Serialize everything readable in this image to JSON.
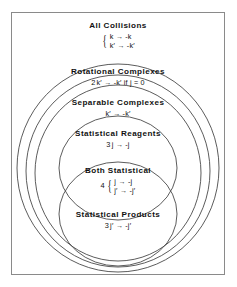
{
  "figure": {
    "title_note": "Nested set (Venn) diagram of collision classes",
    "border_color": "#8a8a8a",
    "curve_color": "#4a4a4a",
    "text_color": "#111111"
  },
  "sets": [
    {
      "id": "all-collisions",
      "label": "All Collisions",
      "number": "",
      "brace": true,
      "relations": [
        "k → -k",
        "k′ → -k′"
      ]
    },
    {
      "id": "rotational-complexes",
      "label": "Rotational Complexes",
      "number": "2",
      "brace": false,
      "relations": [
        "k′ → -k′ if  j = 0"
      ]
    },
    {
      "id": "separable-complexes",
      "label": "Separable Complexes",
      "number": "",
      "brace": false,
      "relations": [
        "k′ → -k′"
      ]
    },
    {
      "id": "statistical-reagents",
      "label": "Statistical Reagents",
      "number": "3",
      "brace": false,
      "relations": [
        "j → -j"
      ]
    },
    {
      "id": "both-statistical",
      "label": "Both Statistical",
      "number": "4",
      "brace": true,
      "relations": [
        "j → -j",
        "j′ → -j′"
      ]
    },
    {
      "id": "statistical-products",
      "label": "Statistical Products",
      "number": "3",
      "brace": false,
      "relations": [
        "j′ → -j′"
      ]
    }
  ],
  "labels": {
    "all_collisions": "All Collisions",
    "all_collisions_rel1": "k → -k",
    "all_collisions_rel2": "k′ → -k′",
    "rotational": "Rotational Complexes",
    "rotational_num": "2",
    "rotational_rel": "k′ → -k′ if  j = 0",
    "separable": "Separable Complexes",
    "separable_rel": "k′ → -k′",
    "reagents": "Statistical Reagents",
    "reagents_num": "3",
    "reagents_rel": "j → -j",
    "both": "Both Statistical",
    "both_num": "4",
    "both_rel1": "j → -j",
    "both_rel2": "j′ → -j′",
    "products": "Statistical Products",
    "products_num": "3",
    "products_rel": "j′ → -j′"
  },
  "ellipses": [
    {
      "name": "rotational-complexes-ellipse",
      "cx": 118,
      "cy": 168,
      "rx": 101,
      "ry": 104
    },
    {
      "name": "separable-complexes-ellipse",
      "cx": 118,
      "cy": 172,
      "rx": 92,
      "ry": 96
    },
    {
      "name": "statistical-reagents-ellipse",
      "cx": 118,
      "cy": 173,
      "rx": 82,
      "ry": 80
    },
    {
      "name": "statistical-reagents-inner-ellipse",
      "cx": 118,
      "cy": 174,
      "rx": 58,
      "ry": 50
    },
    {
      "name": "statistical-products-ellipse",
      "cx": 118,
      "cy": 218,
      "rx": 58,
      "ry": 50
    }
  ]
}
